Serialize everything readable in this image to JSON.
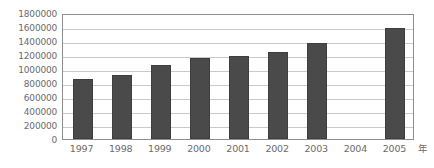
{
  "chart_data": {
    "type": "bar",
    "title": "",
    "subtitle": "",
    "xlabel": "年",
    "ylabel": "",
    "categories": [
      "1997",
      "1998",
      "1999",
      "2000",
      "2001",
      "2002",
      "2003",
      "2004",
      "2005"
    ],
    "values": [
      855000,
      915000,
      1060000,
      1160000,
      1180000,
      1250000,
      1365000,
      null,
      1580000
    ],
    "series": [
      {
        "name": "",
        "values": [
          855000,
          915000,
          1060000,
          1160000,
          1180000,
          1250000,
          1365000,
          null,
          1580000
        ]
      }
    ],
    "ylim": [
      0,
      1800000
    ],
    "ytick_step": 200000,
    "yticks": [
      0,
      200000,
      400000,
      600000,
      800000,
      1000000,
      1200000,
      1400000,
      1600000,
      1800000
    ],
    "ytick_labels": [
      "0",
      "200000",
      "400000",
      "600000",
      "800000",
      "1000000",
      "1200000",
      "1400000",
      "1600000",
      "1800000"
    ],
    "xtick_labels": [
      "1997",
      "1998",
      "1999",
      "2000",
      "2001",
      "2002",
      "2003",
      "2004",
      "2005"
    ],
    "grid": true,
    "grid_axis": "y",
    "legend": false,
    "legend_position": "none",
    "annotations": [],
    "missing_categories": [
      "2004"
    ],
    "colors": {
      "bar": "#4a4a4a",
      "bar_border": "#3e3e3e",
      "gridline": "#c9c9c9",
      "axis": "#8d8d8d",
      "text": "#6b6b6b",
      "background": "#ffffff"
    }
  }
}
